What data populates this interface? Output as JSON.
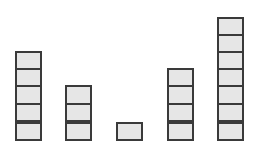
{
  "diagram": {
    "title": "",
    "block_fill": "#e6e6e6",
    "block_border": "#3a3a3a",
    "stacks": [
      {
        "left": 15,
        "count": 5
      },
      {
        "left": 65,
        "count": 3
      },
      {
        "left": 116,
        "count": 1
      },
      {
        "left": 167,
        "count": 4
      },
      {
        "left": 217,
        "count": 7
      }
    ]
  }
}
